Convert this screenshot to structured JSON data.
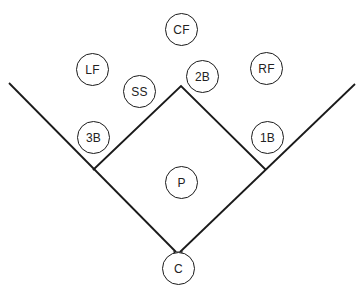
{
  "diagram": {
    "type": "baseball-field-positions",
    "line_color": "#1a1a1a",
    "positions": [
      {
        "key": "cf",
        "label": "CF",
        "name": "center-field",
        "cx": 181,
        "cy": 29
      },
      {
        "key": "lf",
        "label": "LF",
        "name": "left-field",
        "cx": 92,
        "cy": 69
      },
      {
        "key": "rf",
        "label": "RF",
        "name": "right-field",
        "cx": 266,
        "cy": 68
      },
      {
        "key": "ss",
        "label": "SS",
        "name": "shortstop",
        "cx": 139,
        "cy": 91
      },
      {
        "key": "2b",
        "label": "2B",
        "name": "second-base",
        "cx": 202,
        "cy": 76
      },
      {
        "key": "3b",
        "label": "3B",
        "name": "third-base",
        "cx": 93,
        "cy": 137
      },
      {
        "key": "1b",
        "label": "1B",
        "name": "first-base",
        "cx": 267,
        "cy": 137
      },
      {
        "key": "p",
        "label": "P",
        "name": "pitcher",
        "cx": 181,
        "cy": 182
      },
      {
        "key": "c",
        "label": "C",
        "name": "catcher",
        "cx": 178,
        "cy": 268
      }
    ]
  }
}
